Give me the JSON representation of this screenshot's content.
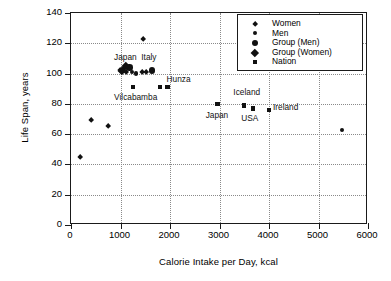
{
  "chart_data": {
    "type": "scatter",
    "title": "",
    "xlabel": "Calorie Intake per Day, kcal",
    "ylabel": "Life Span, years",
    "xlim": [
      0,
      6000
    ],
    "ylim": [
      0,
      140
    ],
    "xticks": [
      0,
      1000,
      2000,
      3000,
      4000,
      5000,
      6000
    ],
    "yticks": [
      0,
      20,
      40,
      60,
      80,
      100,
      120,
      140
    ],
    "grid": true,
    "legend_position": "top-right",
    "series": [
      {
        "name": "Women",
        "marker": "diamond-small",
        "points": [
          {
            "x": 180,
            "y": 45
          },
          {
            "x": 400,
            "y": 69
          },
          {
            "x": 760,
            "y": 65
          },
          {
            "x": 1450,
            "y": 122.5
          },
          {
            "x": 1000,
            "y": 102
          },
          {
            "x": 1060,
            "y": 103
          },
          {
            "x": 1120,
            "y": 101
          },
          {
            "x": 1430,
            "y": 101
          },
          {
            "x": 1510,
            "y": 101
          }
        ]
      },
      {
        "name": "Men",
        "marker": "circle-small",
        "points": [
          {
            "x": 1240,
            "y": 101
          },
          {
            "x": 1320,
            "y": 100
          },
          {
            "x": 5480,
            "y": 63
          }
        ]
      },
      {
        "name": "Group (Men)",
        "marker": "circle-large",
        "points": [
          {
            "x": 1180,
            "y": 104
          },
          {
            "x": 1640,
            "y": 102
          }
        ]
      },
      {
        "name": "Group (Women)",
        "marker": "diamond-large",
        "points": [
          {
            "x": 1030,
            "y": 102
          },
          {
            "x": 1110,
            "y": 105
          }
        ]
      },
      {
        "name": "Nation",
        "marker": "square",
        "points": [
          {
            "x": 1250,
            "y": 91
          },
          {
            "x": 1800,
            "y": 91
          },
          {
            "x": 1950,
            "y": 91
          },
          {
            "x": 2960,
            "y": 80
          },
          {
            "x": 3490,
            "y": 79
          },
          {
            "x": 3680,
            "y": 77
          },
          {
            "x": 4000,
            "y": 76
          }
        ]
      }
    ],
    "annotations": [
      {
        "text": "Japan",
        "x": 870,
        "y": 110
      },
      {
        "text": "Italy",
        "x": 1420,
        "y": 110
      },
      {
        "text": "Vilcabamba",
        "x": 870,
        "y": 84
      },
      {
        "text": "Hunza",
        "x": 1930,
        "y": 96
      },
      {
        "text": "Japan",
        "x": 2720,
        "y": 72
      },
      {
        "text": "Iceland",
        "x": 3280,
        "y": 87
      },
      {
        "text": "USA",
        "x": 3440,
        "y": 70
      },
      {
        "text": "Ireland",
        "x": 4080,
        "y": 77
      }
    ],
    "legend": [
      {
        "label": "Women",
        "marker": "diamond-small"
      },
      {
        "label": "Men",
        "marker": "circle-small"
      },
      {
        "label": "Group (Men)",
        "marker": "circle-large"
      },
      {
        "label": "Group (Women)",
        "marker": "diamond-large"
      },
      {
        "label": "Nation",
        "marker": "square"
      }
    ],
    "colors": {
      "marker": "#111111",
      "axis": "#1a1a1a",
      "grid": "#8a8a8a",
      "background": "#ffffff"
    }
  }
}
